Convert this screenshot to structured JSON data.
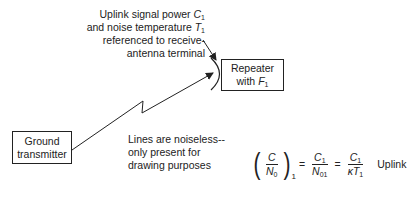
{
  "annotation": {
    "line1_text": "Uplink signal power ",
    "line1_sym": "C",
    "line1_sub": "1",
    "line2_text": "and noise temperature ",
    "line2_sym": "T",
    "line2_sub": "1",
    "line3": "referenced to receive-",
    "line4": "antenna terminal"
  },
  "repeater": {
    "line1": "Repeater",
    "line2_text": "with ",
    "line2_sym": "F",
    "line2_sub": "1"
  },
  "ground": {
    "line1": "Ground",
    "line2": "transmitter"
  },
  "note": {
    "line1": "Lines are noiseless--",
    "line2": "only present for",
    "line3": "drawing purposes"
  },
  "equation": {
    "lhs_num": "C",
    "lhs_den": "N",
    "lhs_den_sub": "0",
    "lhs_outer_sub": "1",
    "eq1": "=",
    "mid_num": "C",
    "mid_num_sub": "1",
    "mid_den": "N",
    "mid_den_sub": "01",
    "eq2": "=",
    "rhs_num": "C",
    "rhs_num_sub": "1",
    "rhs_den_k": "κ",
    "rhs_den": "T",
    "rhs_den_sub": "1",
    "label": "Uplink"
  },
  "colors": {
    "stroke": "#222222",
    "background": "#ffffff"
  }
}
